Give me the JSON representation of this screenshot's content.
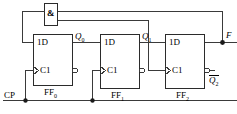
{
  "diagram": {
    "colors": {
      "wire": "#3a3a3a",
      "box_border": "#2b2b2b",
      "text": "#000000",
      "background": "#ffffff"
    },
    "gate": {
      "symbol": "&",
      "name": "and-gate"
    },
    "clock_input": {
      "label": "CP"
    },
    "output": {
      "label": "F"
    },
    "flipflops": [
      {
        "name": "FF0",
        "label": "FF",
        "subscript": "0",
        "data_pin": "1D",
        "clock_pin": "C1",
        "q_label": "Q",
        "q_subscript": "0"
      },
      {
        "name": "FF1",
        "label": "FF",
        "subscript": "1",
        "data_pin": "1D",
        "clock_pin": "C1",
        "q_label": "Q",
        "q_subscript": "1"
      },
      {
        "name": "FF2",
        "label": "FF",
        "subscript": "2",
        "data_pin": "1D",
        "clock_pin": "C1",
        "qbar_label": "Q",
        "qbar_subscript": "2"
      }
    ]
  }
}
